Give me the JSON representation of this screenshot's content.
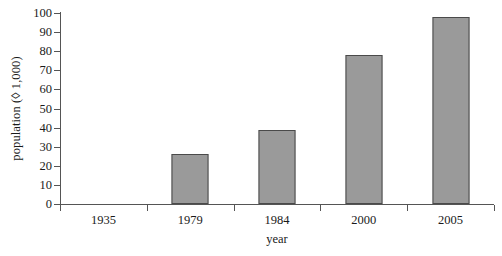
{
  "chart_data": {
    "type": "bar",
    "title": "",
    "xlabel": "year",
    "ylabel": "population (◊ 1,000)",
    "categories": [
      "1935",
      "1979",
      "1984",
      "2000",
      "2005"
    ],
    "values": [
      0,
      26,
      39,
      78,
      98
    ],
    "series": [
      {
        "name": "population",
        "values": [
          0,
          26,
          39,
          78,
          98
        ]
      }
    ],
    "ylim": [
      0,
      100
    ],
    "ytick_labels": [
      "0",
      "10",
      "20",
      "30",
      "40",
      "50",
      "60",
      "70",
      "80",
      "90",
      "100"
    ],
    "ytick_values": [
      0,
      10,
      20,
      30,
      40,
      50,
      60,
      70,
      80,
      90,
      100
    ],
    "grid": false,
    "legend": false,
    "legend_position": "none",
    "bar_color": "#9a9a9a",
    "bar_edge_color": "#4a4a4a",
    "axis_color": "#555555",
    "background_color": "#ffffff"
  }
}
